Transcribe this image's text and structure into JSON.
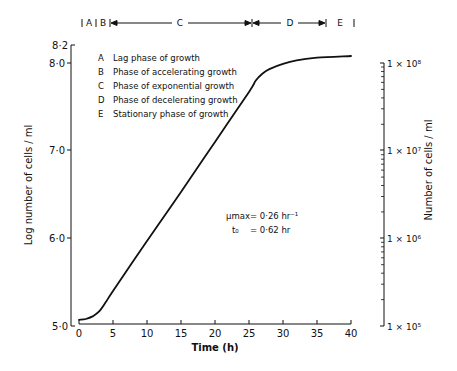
{
  "chart_data": {
    "type": "line",
    "title": "",
    "xlabel": "Time (h)",
    "ylabel": "Log number of cells / ml",
    "ylabel_right": "Number of cells / ml",
    "xlim": [
      0,
      40
    ],
    "ylim": [
      5.0,
      8.2
    ],
    "x_ticks": [
      "0",
      "5",
      "10",
      "15",
      "20",
      "25",
      "30",
      "35",
      "40"
    ],
    "y_ticks": [
      "5·0",
      "6·0",
      "7·0",
      "8·0",
      "8·2"
    ],
    "y_right_ticks": [
      "1 × 10⁵",
      "1 × 10⁶",
      "1 × 10⁷",
      "1 × 10⁸"
    ],
    "grid": false,
    "series": [
      {
        "name": "Growth curve",
        "x": [
          0,
          1,
          2,
          3,
          4,
          5,
          10,
          15,
          20,
          25,
          26,
          27,
          28,
          30,
          32,
          35,
          40
        ],
        "values": [
          5.07,
          5.08,
          5.11,
          5.17,
          5.28,
          5.4,
          5.97,
          6.53,
          7.1,
          7.67,
          7.8,
          7.88,
          7.93,
          7.99,
          8.03,
          8.06,
          8.08
        ]
      }
    ],
    "phases": [
      {
        "key": "A",
        "label": "Lag phase of growth"
      },
      {
        "key": "B",
        "label": "Phase of accelerating growth"
      },
      {
        "key": "C",
        "label": "Phase of exponential growth"
      },
      {
        "key": "D",
        "label": "Phase of decelerating growth"
      },
      {
        "key": "E",
        "label": "Stationary phase of growth"
      }
    ],
    "annotations": [
      {
        "label": "μmax",
        "value": "= 0·26 hr⁻¹"
      },
      {
        "label": "t₀",
        "value": "= 0·62 hr"
      }
    ]
  }
}
